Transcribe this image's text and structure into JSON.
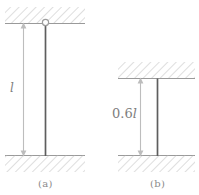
{
  "figure": {
    "background_color": "#ffffff",
    "line_color_column": "#595959",
    "line_color_dimension": "#b0b0b0",
    "hatch_color": "#c8c8c8",
    "support_line_color": "#9a9a9a",
    "text_color": "#8a8a8a"
  },
  "panels": [
    {
      "id": "a",
      "caption": "(a)",
      "dimension_label": "l",
      "dimension_value": "l",
      "top_support": "pinned",
      "bottom_support": "fixed",
      "pin_marker": "circle"
    },
    {
      "id": "b",
      "caption": "(b)",
      "dimension_label_prefix": "0.6",
      "dimension_label_symbol": "l",
      "dimension_value": "0.6l",
      "top_support": "fixed",
      "bottom_support": "fixed",
      "pin_marker": "none"
    }
  ],
  "icons": {
    "arrow_up": "arrow-up-icon",
    "arrow_down": "arrow-down-icon",
    "pin_joint": "pin-joint-icon",
    "hatching": "hatch-pattern-icon"
  }
}
